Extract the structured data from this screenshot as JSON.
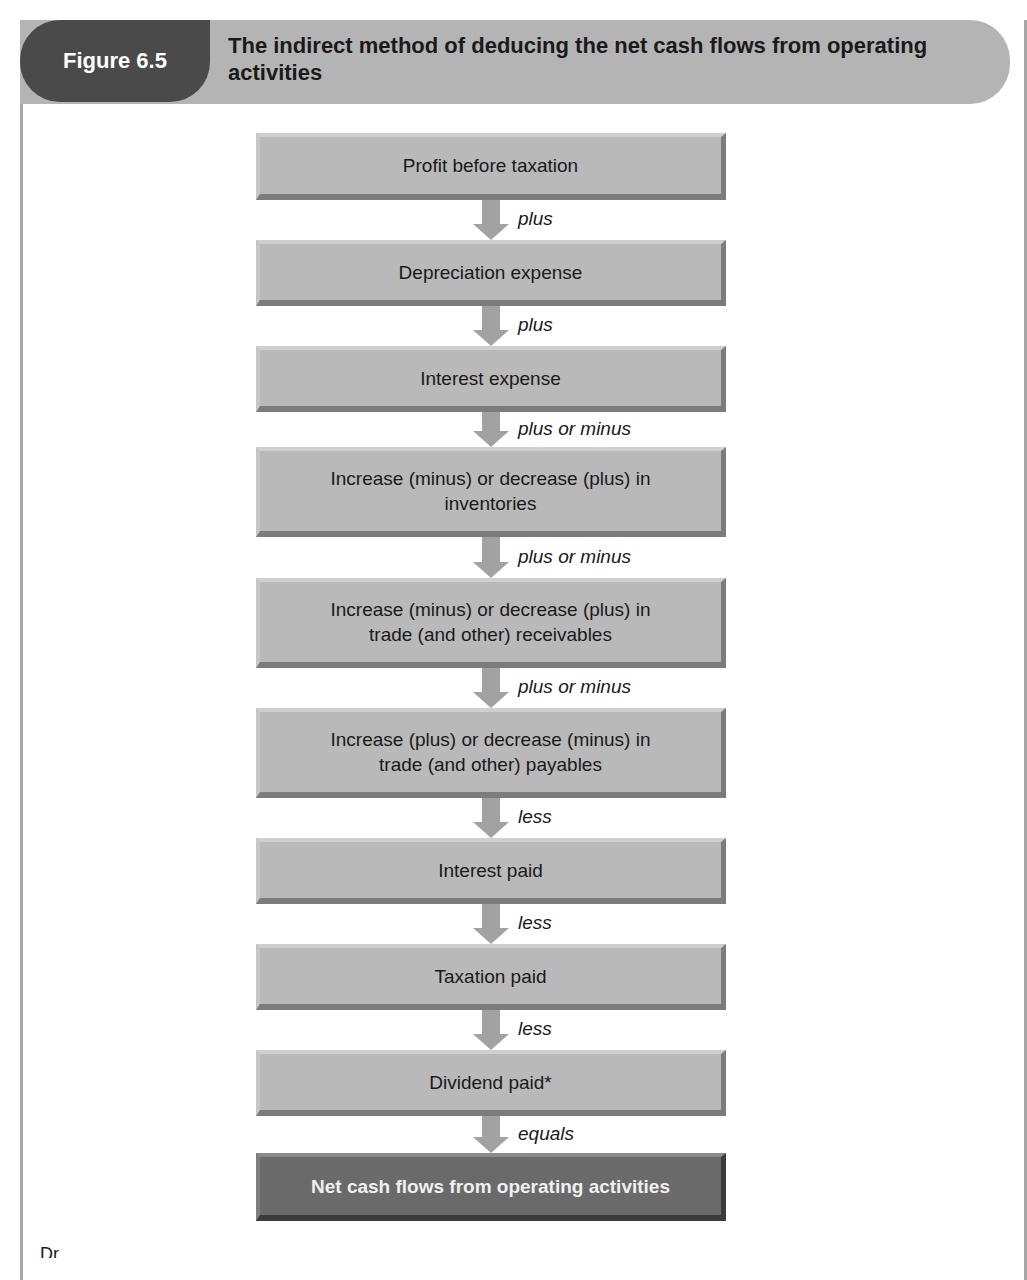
{
  "figure": {
    "label": "Figure 6.5",
    "title": "The indirect method of deducing the net cash flows from operating activities"
  },
  "flow": {
    "steps": [
      {
        "label": "Profit before taxation",
        "top": 133,
        "height": 67
      },
      {
        "label": "Depreciation expense",
        "top": 240,
        "height": 66
      },
      {
        "label": "Interest expense",
        "top": 346,
        "height": 66
      },
      {
        "label": "Increase (minus) or decrease (plus) in inventories",
        "top": 447,
        "height": 90
      },
      {
        "label": "Increase (minus) or decrease (plus) in trade (and other) receivables",
        "top": 578,
        "height": 90
      },
      {
        "label": "Increase (plus) or decrease (minus) in trade (and other) payables",
        "top": 708,
        "height": 90
      },
      {
        "label": "Interest paid",
        "top": 838,
        "height": 66
      },
      {
        "label": "Taxation paid",
        "top": 944,
        "height": 66
      },
      {
        "label": "Dividend paid*",
        "top": 1050,
        "height": 66
      }
    ],
    "operators": [
      {
        "label": "plus",
        "top": 200,
        "height": 40
      },
      {
        "label": "plus",
        "top": 306,
        "height": 40
      },
      {
        "label": "plus or minus",
        "top": 412,
        "height": 35
      },
      {
        "label": "plus or minus",
        "top": 537,
        "height": 41
      },
      {
        "label": "plus or minus",
        "top": 668,
        "height": 40
      },
      {
        "label": "less",
        "top": 798,
        "height": 40
      },
      {
        "label": "less",
        "top": 904,
        "height": 40
      },
      {
        "label": "less",
        "top": 1010,
        "height": 40
      },
      {
        "label": "equals",
        "top": 1116,
        "height": 37
      }
    ],
    "result": {
      "label": "Net cash flows from operating activities",
      "top": 1153,
      "height": 68
    }
  },
  "caption_fragment": "Dr...",
  "colors": {
    "header_bar": "#b4b4b4",
    "figure_tab": "#4a4a4a",
    "box": "#b9b9b9",
    "final_box": "#6a6a6a",
    "arrow": "#a2a2a2"
  }
}
